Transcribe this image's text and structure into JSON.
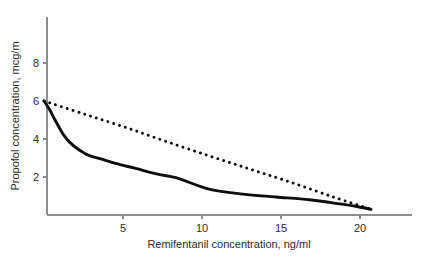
{
  "chart_data": {
    "type": "line",
    "title": "",
    "subtitle": "",
    "xlabel": "Remifentanil concentration, ng/ml",
    "ylabel": "Propofol concentration, mcg/m",
    "xlim": [
      0,
      23.3
    ],
    "ylim": [
      0,
      8.9
    ],
    "xticks": [
      5,
      10,
      15,
      20
    ],
    "yticks": [
      2,
      4,
      6,
      8
    ],
    "xtick_labels": [
      "5",
      "10",
      "15",
      "20"
    ],
    "ytick_labels": [
      "2",
      "4",
      "6",
      "8"
    ],
    "grid": false,
    "legend": "none",
    "legend_position": "none",
    "annotations": [],
    "series": [
      {
        "name": "solid-curve",
        "style": "solid",
        "color": "#0d0d0d",
        "x": [
          0.0,
          0.35,
          0.7,
          1.0,
          1.25,
          1.6,
          2.1,
          2.8,
          3.6,
          4.6,
          5.8,
          7.2,
          8.4,
          10.5,
          12.6,
          14.7,
          16.8,
          18.6,
          19.8,
          20.7
        ],
        "y": [
          6.0,
          5.55,
          5.0,
          4.55,
          4.2,
          3.85,
          3.5,
          3.15,
          2.95,
          2.7,
          2.45,
          2.15,
          1.95,
          1.35,
          1.1,
          0.95,
          0.8,
          0.6,
          0.45,
          0.3
        ]
      },
      {
        "name": "dotted-line",
        "style": "dotted",
        "color": "#0d0d0d",
        "x": [
          0.0,
          2.6,
          5.2,
          7.8,
          10.5,
          13.1,
          15.7,
          18.3,
          20.7
        ],
        "y": [
          6.0,
          5.3,
          4.6,
          3.85,
          3.1,
          2.4,
          1.7,
          0.95,
          0.3
        ]
      }
    ],
    "axis_color": "#8e8e8e",
    "background": "#ffffff"
  },
  "geometry": {
    "plot_left": 47,
    "plot_right": 412,
    "plot_top": 17,
    "plot_bottom": 215,
    "x_origin_px": 44.0,
    "x_scale_px_per_unit": 15.8,
    "y_origin_px": 215.0,
    "y_scale_px_per_unit": 19.0
  }
}
